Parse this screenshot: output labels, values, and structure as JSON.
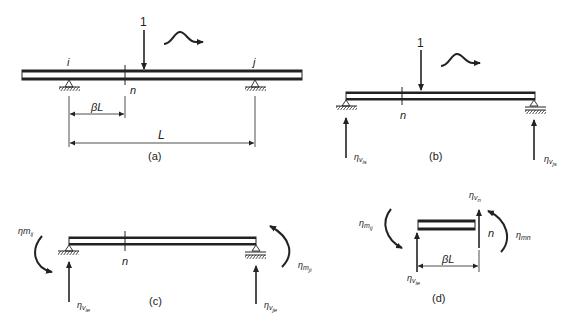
{
  "diagram": {
    "panels": [
      {
        "id": "a",
        "caption": "(a)",
        "load_label": "1",
        "node_i": "i",
        "node_j": "j",
        "section": "n",
        "dim_partial": "βL",
        "dim_span": "L"
      },
      {
        "id": "b",
        "caption": "(b)",
        "load_label": "1",
        "section": "n",
        "reaction_left": {
          "base": "η",
          "sub": "v",
          "subsub": "is"
        },
        "reaction_right": {
          "base": "η",
          "sub": "v",
          "subsub": "js"
        }
      },
      {
        "id": "c",
        "caption": "(c)",
        "section": "n",
        "moment_left": {
          "base": "ηm",
          "sub": "ij"
        },
        "moment_right": {
          "base": "η",
          "sub": "m",
          "subsub": "ji"
        },
        "reaction_left": {
          "base": "η",
          "sub": "v",
          "subsub": "ie"
        },
        "reaction_right": {
          "base": "η",
          "sub": "v",
          "subsub": "je"
        }
      },
      {
        "id": "d",
        "caption": "(d)",
        "section": "n",
        "dim": "βL",
        "moment_left": {
          "base": "η",
          "sub": "m",
          "subsub": "ij"
        },
        "moment_right": {
          "base": "η",
          "sub": "mn"
        },
        "shear_left": {
          "base": "η",
          "sub": "v",
          "subsub": "ie"
        },
        "shear_right": {
          "base": "η",
          "sub": "v",
          "subsub": "n"
        }
      }
    ],
    "colors": {
      "ink": "#222222",
      "background": "#ffffff"
    }
  }
}
